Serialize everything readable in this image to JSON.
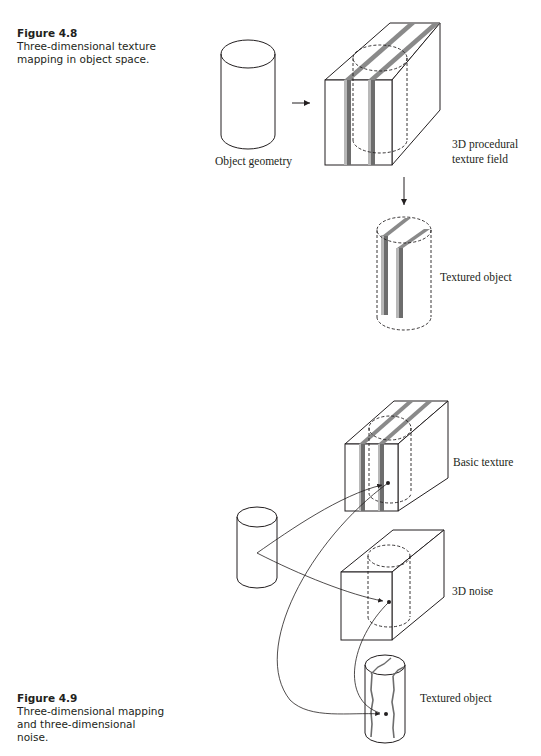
{
  "figure_48": {
    "number": "Figure 4.8",
    "caption": "Three-dimensional texture mapping in object space.",
    "caption_lines": [
      "Three-dimensional texture",
      "mapping in object space."
    ],
    "labels": {
      "object_geometry": "Object geometry",
      "texture_field_line1": "3D procedural",
      "texture_field_line2": "texture field",
      "textured_object": "Textured object"
    }
  },
  "figure_49": {
    "number": "Figure 4.9",
    "caption": "Three-dimensional mapping and three-dimensional noise.",
    "caption_lines": [
      "Three-dimensional mapping",
      "and three-dimensional",
      "noise."
    ],
    "labels": {
      "basic_texture": "Basic texture",
      "noise": "3D noise",
      "textured_object": "Textured object"
    }
  },
  "colors": {
    "ink": "#231f20",
    "stripe_dark": "#6d6d6d",
    "stripe_light": "#b8b8b8"
  }
}
